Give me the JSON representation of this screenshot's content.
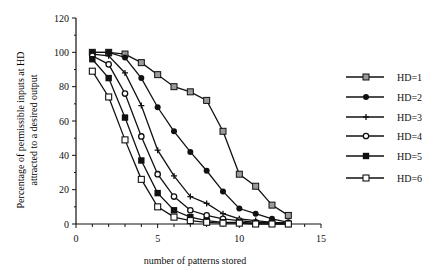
{
  "chart_data": {
    "type": "line",
    "title": "",
    "xlabel": "number of patterns stored",
    "ylabel_line1": "Percentage of permissible inputs at HD",
    "ylabel_line2": "attracted to a desired output",
    "xlim": [
      0,
      15
    ],
    "ylim": [
      0,
      120
    ],
    "xticks": [
      0,
      5,
      10,
      15
    ],
    "yticks": [
      0,
      20,
      40,
      60,
      80,
      100,
      120
    ],
    "grid": false,
    "legend_position": "right",
    "x": [
      1,
      2,
      3,
      4,
      5,
      6,
      7,
      8,
      9,
      10,
      11,
      12,
      13
    ],
    "series": [
      {
        "name": "HD=1",
        "marker": "gray-square",
        "values": [
          100,
          100,
          99,
          94,
          87,
          80,
          77,
          72,
          54,
          29,
          22,
          11,
          5
        ]
      },
      {
        "name": "HD=2",
        "marker": "filled-circle",
        "values": [
          100,
          100,
          97,
          85,
          68,
          54,
          42,
          31,
          19,
          9,
          6,
          3,
          1
        ]
      },
      {
        "name": "HD=3",
        "marker": "plus",
        "values": [
          99,
          98,
          88,
          69,
          43,
          28,
          16,
          12,
          6,
          3,
          2,
          1,
          0.5
        ]
      },
      {
        "name": "HD=4",
        "marker": "open-diamond-circle",
        "values": [
          98,
          93,
          76,
          51,
          29,
          16,
          8,
          5,
          3,
          2,
          1,
          1,
          0.5
        ]
      },
      {
        "name": "HD=5",
        "marker": "filled-square",
        "values": [
          96,
          85,
          62,
          37,
          18,
          8,
          4,
          2,
          1,
          1,
          0.5,
          0.5,
          0
        ]
      },
      {
        "name": "HD=6",
        "marker": "open-square",
        "values": [
          89,
          74,
          49,
          26,
          10,
          4,
          2,
          1,
          0.5,
          0.5,
          0,
          0,
          0
        ]
      }
    ]
  },
  "colors": {
    "line": "#111111",
    "gray_marker": "#9a9a9a",
    "background": "#ffffff"
  }
}
